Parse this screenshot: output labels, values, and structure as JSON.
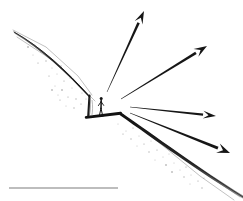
{
  "figure": {
    "title": "Sketch of an observer standing on a terrace ledge with radiating sightline arrows",
    "caption": "",
    "background_color": "#ffffff",
    "ink_color": "#161616",
    "ghost_color": "#9a9a9a",
    "stipple_color": "#6e6e6e",
    "width": 243,
    "height": 201
  },
  "slope": {
    "name": "hillslope-profile",
    "description": "Descending terrain profile running from upper-left to lower-right, broken by a cut terrace",
    "upper_segment": {
      "start": [
        14,
        32
      ],
      "end": [
        89,
        96
      ],
      "stroke_width_start": 0.9,
      "stroke_width_end": 3.4
    },
    "scarp": {
      "top": [
        89,
        96
      ],
      "bottom": [
        88,
        116
      ],
      "stroke_width": 2.2
    },
    "terrace": {
      "left": [
        86,
        117
      ],
      "right": [
        120,
        113
      ],
      "stroke_width": 3.0
    },
    "lower_segment": {
      "start": [
        120,
        113
      ],
      "end": [
        243,
        197
      ],
      "stroke_width_start": 3.2,
      "stroke_width_end": 1.2
    },
    "ghost_lines": [
      {
        "points": "13,30 46,47 78,76 92,95",
        "width": 0.7
      },
      {
        "points": "16,36 52,60 84,90 95,100",
        "width": 0.7
      },
      {
        "points": "124,117 168,146 206,174 239,196",
        "width": 0.7
      },
      {
        "points": "122,115 162,145 200,176 233,199",
        "width": 0.7
      }
    ]
  },
  "observer": {
    "name": "standing-human-figure",
    "position": [
      101,
      116
    ],
    "height_px": 20,
    "description": "Small standing human figure for scale on the terrace"
  },
  "arrows": {
    "name": "sightline-arrows",
    "origin": [
      107,
      104
    ],
    "description": "Four tapered arrows radiating outward from the observer position toward the right",
    "items": [
      {
        "id": "arrow-up-steep",
        "label": "arrow-1",
        "tail": [
          107,
          92
        ],
        "head": [
          144,
          11
        ],
        "bearing_deg": 65,
        "tail_width": 0.5,
        "head_width": 2.6
      },
      {
        "id": "arrow-upper-right",
        "label": "arrow-2",
        "tail": [
          121,
          99
        ],
        "head": [
          207,
          46
        ],
        "bearing_deg": 32,
        "tail_width": 0.5,
        "head_width": 2.8
      },
      {
        "id": "arrow-right-flat",
        "label": "arrow-3",
        "tail": [
          130,
          107
        ],
        "head": [
          216,
          116
        ],
        "bearing_deg": -6,
        "tail_width": 0.5,
        "head_width": 2.4
      },
      {
        "id": "arrow-lower-right",
        "label": "arrow-4",
        "tail": [
          130,
          113
        ],
        "head": [
          230,
          153
        ],
        "bearing_deg": -21,
        "tail_width": 0.5,
        "head_width": 3.0
      }
    ]
  },
  "scale_bar": {
    "name": "scale-bar",
    "start": [
      9,
      188
    ],
    "end": [
      118,
      188
    ],
    "length_px": 109,
    "stroke_width": 1.1,
    "color": "#7d7d7d",
    "label": ""
  },
  "stipple": {
    "name": "ground-texture-stipple",
    "description": "Scattered dots suggesting loose debris along the slope",
    "dots": [
      [
        28,
        47
      ],
      [
        33,
        55
      ],
      [
        41,
        52
      ],
      [
        38,
        63
      ],
      [
        46,
        61
      ],
      [
        52,
        68
      ],
      [
        49,
        76
      ],
      [
        57,
        74
      ],
      [
        61,
        66
      ],
      [
        64,
        81
      ],
      [
        70,
        78
      ],
      [
        55,
        86
      ],
      [
        62,
        90
      ],
      [
        72,
        88
      ],
      [
        79,
        84
      ],
      [
        68,
        97
      ],
      [
        76,
        99
      ],
      [
        82,
        93
      ],
      [
        60,
        100
      ],
      [
        66,
        106
      ],
      [
        74,
        108
      ],
      [
        81,
        104
      ],
      [
        86,
        99
      ],
      [
        58,
        95
      ],
      [
        52,
        90
      ],
      [
        118,
        124
      ],
      [
        126,
        131
      ],
      [
        133,
        128
      ],
      [
        131,
        139
      ],
      [
        139,
        136
      ],
      [
        144,
        144
      ],
      [
        151,
        141
      ],
      [
        149,
        152
      ],
      [
        157,
        150
      ],
      [
        163,
        157
      ],
      [
        169,
        154
      ],
      [
        166,
        165
      ],
      [
        174,
        163
      ],
      [
        180,
        170
      ],
      [
        186,
        167
      ],
      [
        184,
        177
      ],
      [
        191,
        175
      ],
      [
        198,
        181
      ],
      [
        204,
        178
      ],
      [
        202,
        188
      ],
      [
        123,
        134
      ],
      [
        137,
        146
      ],
      [
        155,
        160
      ],
      [
        172,
        172
      ],
      [
        190,
        184
      ]
    ]
  }
}
